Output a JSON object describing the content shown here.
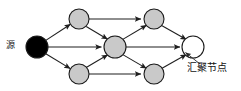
{
  "diagram": {
    "type": "directed-acyclic-graph",
    "canvas": {
      "width": 241,
      "height": 91,
      "background": "#ffffff"
    },
    "labels": {
      "source": "源",
      "sink": "汇聚节点"
    },
    "colors": {
      "source_fill": "#000000",
      "relay_fill": "#c9c9c9",
      "sink_fill": "#ffffff",
      "stroke": "#1a1a1a",
      "edge": "#1f1f1f"
    },
    "nodes": [
      {
        "id": "source",
        "name": "source-node",
        "label": "源",
        "cx": 37,
        "cy": 47,
        "r": 11,
        "fill": "#000000"
      },
      {
        "id": "relay-tl",
        "name": "relay-node-top-left",
        "label": "",
        "cx": 79,
        "cy": 19,
        "r": 10,
        "fill": "#c9c9c9"
      },
      {
        "id": "relay-tr",
        "name": "relay-node-top-right",
        "label": "",
        "cx": 154,
        "cy": 19,
        "r": 10,
        "fill": "#c9c9c9"
      },
      {
        "id": "relay-c",
        "name": "relay-node-center",
        "label": "",
        "cx": 115,
        "cy": 47,
        "r": 11,
        "fill": "#c9c9c9"
      },
      {
        "id": "relay-bl",
        "name": "relay-node-bottom-left",
        "label": "",
        "cx": 79,
        "cy": 74,
        "r": 10,
        "fill": "#c9c9c9"
      },
      {
        "id": "relay-br",
        "name": "relay-node-bottom-right",
        "label": "",
        "cx": 154,
        "cy": 74,
        "r": 10,
        "fill": "#c9c9c9"
      },
      {
        "id": "sink",
        "name": "sink-node",
        "label": "汇聚节点",
        "cx": 193,
        "cy": 47,
        "r": 11,
        "fill": "#ffffff"
      }
    ],
    "edges": [
      {
        "from": "source",
        "to": "relay-tl",
        "arrow": true
      },
      {
        "from": "source",
        "to": "relay-c",
        "arrow": true
      },
      {
        "from": "source",
        "to": "relay-bl",
        "arrow": true
      },
      {
        "from": "relay-tl",
        "to": "relay-tr",
        "arrow": true
      },
      {
        "from": "relay-tl",
        "to": "relay-c",
        "arrow": true
      },
      {
        "from": "relay-bl",
        "to": "relay-c",
        "arrow": true
      },
      {
        "from": "relay-bl",
        "to": "relay-br",
        "arrow": true
      },
      {
        "from": "relay-c",
        "to": "relay-tr",
        "arrow": true
      },
      {
        "from": "relay-c",
        "to": "relay-br",
        "arrow": true
      },
      {
        "from": "relay-c",
        "to": "sink",
        "arrow": true
      },
      {
        "from": "relay-tr",
        "to": "sink",
        "arrow": true
      },
      {
        "from": "relay-br",
        "to": "sink",
        "arrow": true
      }
    ],
    "annotation": {
      "leader_from": {
        "x": 199,
        "y": 64
      },
      "leader_to": {
        "x": 186,
        "y": 53
      },
      "target": "sink"
    }
  }
}
